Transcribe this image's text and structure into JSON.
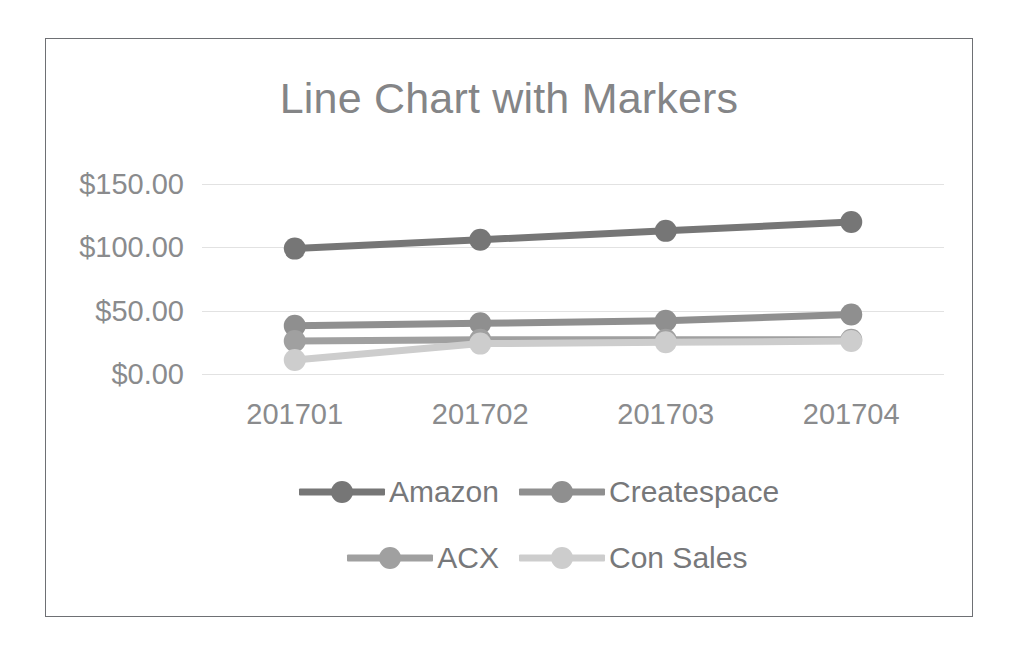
{
  "chart_data": {
    "type": "line",
    "title": "Line Chart with Markers",
    "xlabel": "",
    "ylabel": "",
    "categories": [
      "201701",
      "201702",
      "201703",
      "201704"
    ],
    "ytick_labels": [
      "$150.00",
      "$100.00",
      "$50.00",
      "$0.00"
    ],
    "ytick_values": [
      150,
      100,
      50,
      0
    ],
    "ylim": [
      0,
      150
    ],
    "grid": true,
    "legend_position": "bottom",
    "markers": true,
    "series": [
      {
        "name": "Amazon",
        "color": "#767676",
        "values": [
          99,
          106,
          113,
          120
        ]
      },
      {
        "name": "Createspace",
        "color": "#8f8f8f",
        "values": [
          38,
          40,
          42,
          47
        ]
      },
      {
        "name": "ACX",
        "color": "#a0a0a0",
        "values": [
          26,
          27,
          27,
          27
        ]
      },
      {
        "name": "Con Sales",
        "color": "#cdcdcd",
        "values": [
          11,
          24,
          25,
          26
        ]
      }
    ]
  },
  "legend": {
    "rows": [
      [
        {
          "label": "Amazon",
          "color": "#767676"
        },
        {
          "label": "Createspace",
          "color": "#8f8f8f"
        }
      ],
      [
        {
          "label": "ACX",
          "color": "#a0a0a0"
        },
        {
          "label": "Con Sales",
          "color": "#cdcdcd"
        }
      ]
    ]
  },
  "style": {
    "frame_color": "#6e7074",
    "text_color": "#8a8b8d",
    "title_color": "#848587",
    "grid_color": "#e2e2e2",
    "background": "#ffffff"
  }
}
